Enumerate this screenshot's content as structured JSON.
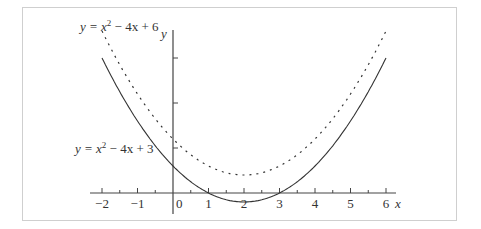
{
  "chart_data": {
    "type": "line",
    "title": "",
    "xlabel": "x",
    "ylabel": "y",
    "xlim": [
      -2,
      6
    ],
    "x_ticks": [
      "-2",
      "-1",
      "0",
      "1",
      "2",
      "3",
      "4",
      "5",
      "6"
    ],
    "y_ticks_unlabeled": [
      5,
      10,
      15
    ],
    "grid": false,
    "series": [
      {
        "name": "y = x² − 4x + 6",
        "style": "dashed",
        "x": [
          -2,
          -1,
          0,
          1,
          2,
          3,
          4,
          5,
          6
        ],
        "values": [
          18,
          11,
          6,
          3,
          2,
          3,
          6,
          11,
          18
        ]
      },
      {
        "name": "y = x² − 4x + 3",
        "style": "solid",
        "x": [
          -2,
          -1,
          0,
          1,
          2,
          3,
          4,
          5,
          6
        ],
        "values": [
          15,
          8,
          3,
          0,
          -1,
          0,
          3,
          8,
          15
        ]
      }
    ],
    "annotations": [
      {
        "text": "y = x² − 4x + 6",
        "near": "upper-left, dashed curve"
      },
      {
        "text": "y = x² − 4x + 3",
        "near": "left, solid curve"
      }
    ]
  },
  "labels": {
    "dashed_prefix": "y = x",
    "dashed_suffix": " − 4x + 6",
    "solid_prefix": "y = x",
    "solid_suffix": " − 4x + 3",
    "exp": "2",
    "x_axis": "x",
    "y_axis": "y",
    "ticks": [
      "−2",
      "−1",
      "0",
      "1",
      "2",
      "3",
      "4",
      "5",
      "6"
    ]
  }
}
